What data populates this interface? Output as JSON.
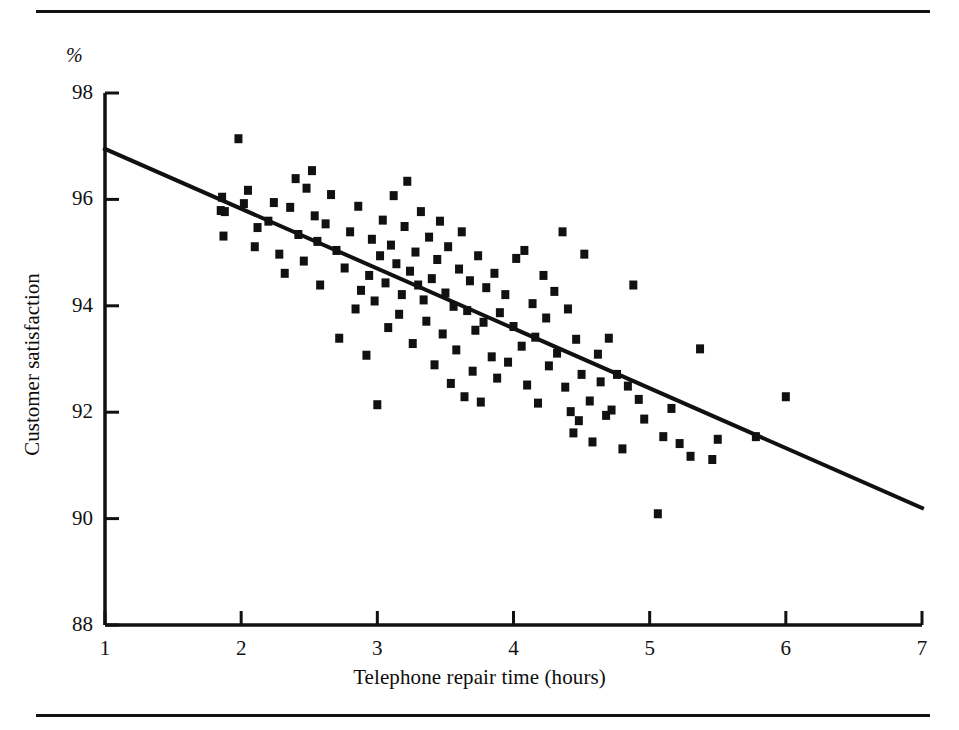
{
  "figure": {
    "has_top_rule": true,
    "has_bottom_rule": true,
    "ink_color": "#111111",
    "background_color": "#ffffff"
  },
  "chart_data": {
    "type": "scatter",
    "title": "",
    "subtitle": "",
    "xlabel": "Telephone repair time (hours)",
    "ylabel": "Customer satisfaction",
    "unit_label": "%",
    "xlim": [
      1,
      7
    ],
    "ylim": [
      88,
      98
    ],
    "xticks": [
      1,
      2,
      3,
      4,
      5,
      6,
      7
    ],
    "yticks": [
      88,
      90,
      92,
      94,
      96,
      98
    ],
    "xtick_labels": [
      "1",
      "2",
      "3",
      "4",
      "5",
      "6",
      "7"
    ],
    "ytick_labels": [
      "88",
      "90",
      "92",
      "94",
      "96",
      "98"
    ],
    "grid": false,
    "legend": null,
    "marker": "square",
    "marker_color": "#111111",
    "marker_size_px": 8,
    "trendline": {
      "type": "linear-fit",
      "color": "#111111",
      "width_px": 4,
      "x_start": 1.0,
      "y_start": 96.95,
      "x_end": 7.0,
      "y_end": 90.2,
      "slope": -1.125,
      "intercept": 98.075
    },
    "series": [
      {
        "name": "Repair time vs satisfaction",
        "points": [
          [
            1.98,
            97.15
          ],
          [
            1.86,
            96.05
          ],
          [
            1.88,
            95.78
          ],
          [
            1.85,
            95.8
          ],
          [
            1.87,
            95.32
          ],
          [
            2.02,
            95.93
          ],
          [
            2.05,
            96.18
          ],
          [
            2.12,
            95.48
          ],
          [
            2.1,
            95.12
          ],
          [
            2.2,
            95.6
          ],
          [
            2.24,
            95.95
          ],
          [
            2.28,
            94.98
          ],
          [
            2.32,
            94.62
          ],
          [
            2.36,
            95.86
          ],
          [
            2.4,
            96.4
          ],
          [
            2.42,
            95.35
          ],
          [
            2.46,
            94.85
          ],
          [
            2.48,
            96.22
          ],
          [
            2.52,
            96.55
          ],
          [
            2.54,
            95.7
          ],
          [
            2.56,
            95.22
          ],
          [
            2.58,
            94.4
          ],
          [
            2.62,
            95.55
          ],
          [
            2.66,
            96.1
          ],
          [
            2.7,
            95.05
          ],
          [
            2.72,
            93.4
          ],
          [
            2.76,
            94.72
          ],
          [
            2.8,
            95.4
          ],
          [
            2.84,
            93.95
          ],
          [
            2.86,
            95.88
          ],
          [
            2.88,
            94.3
          ],
          [
            2.92,
            93.08
          ],
          [
            2.94,
            94.58
          ],
          [
            2.96,
            95.26
          ],
          [
            2.98,
            94.1
          ],
          [
            3.0,
            92.15
          ],
          [
            3.02,
            94.95
          ],
          [
            3.04,
            95.62
          ],
          [
            3.06,
            94.44
          ],
          [
            3.08,
            93.6
          ],
          [
            3.1,
            95.15
          ],
          [
            3.12,
            96.08
          ],
          [
            3.14,
            94.8
          ],
          [
            3.16,
            93.85
          ],
          [
            3.18,
            94.22
          ],
          [
            3.2,
            95.5
          ],
          [
            3.22,
            96.35
          ],
          [
            3.24,
            94.66
          ],
          [
            3.26,
            93.3
          ],
          [
            3.28,
            95.02
          ],
          [
            3.3,
            94.4
          ],
          [
            3.32,
            95.78
          ],
          [
            3.34,
            94.12
          ],
          [
            3.36,
            93.72
          ],
          [
            3.38,
            95.3
          ],
          [
            3.4,
            94.52
          ],
          [
            3.42,
            92.9
          ],
          [
            3.44,
            94.88
          ],
          [
            3.46,
            95.6
          ],
          [
            3.48,
            93.48
          ],
          [
            3.5,
            94.25
          ],
          [
            3.52,
            95.12
          ],
          [
            3.54,
            92.55
          ],
          [
            3.56,
            94.0
          ],
          [
            3.58,
            93.18
          ],
          [
            3.6,
            94.7
          ],
          [
            3.62,
            95.4
          ],
          [
            3.64,
            92.3
          ],
          [
            3.66,
            93.92
          ],
          [
            3.68,
            94.48
          ],
          [
            3.7,
            92.78
          ],
          [
            3.72,
            93.55
          ],
          [
            3.74,
            94.95
          ],
          [
            3.76,
            92.2
          ],
          [
            3.78,
            93.7
          ],
          [
            3.8,
            94.35
          ],
          [
            3.84,
            93.05
          ],
          [
            3.86,
            94.62
          ],
          [
            3.88,
            92.65
          ],
          [
            3.9,
            93.88
          ],
          [
            3.94,
            94.22
          ],
          [
            3.96,
            92.95
          ],
          [
            4.0,
            93.62
          ],
          [
            4.02,
            94.9
          ],
          [
            4.06,
            93.25
          ],
          [
            4.08,
            95.05
          ],
          [
            4.1,
            92.52
          ],
          [
            4.14,
            94.05
          ],
          [
            4.16,
            93.42
          ],
          [
            4.18,
            92.18
          ],
          [
            4.22,
            94.58
          ],
          [
            4.24,
            93.78
          ],
          [
            4.26,
            92.88
          ],
          [
            4.3,
            94.28
          ],
          [
            4.32,
            93.12
          ],
          [
            4.36,
            95.4
          ],
          [
            4.38,
            92.48
          ],
          [
            4.4,
            93.95
          ],
          [
            4.42,
            92.02
          ],
          [
            4.44,
            91.62
          ],
          [
            4.46,
            93.38
          ],
          [
            4.48,
            91.85
          ],
          [
            4.5,
            92.72
          ],
          [
            4.52,
            94.98
          ],
          [
            4.56,
            92.22
          ],
          [
            4.58,
            91.45
          ],
          [
            4.62,
            93.1
          ],
          [
            4.64,
            92.58
          ],
          [
            4.68,
            91.95
          ],
          [
            4.7,
            93.4
          ],
          [
            4.72,
            92.05
          ],
          [
            4.76,
            92.72
          ],
          [
            4.8,
            91.32
          ],
          [
            4.84,
            92.5
          ],
          [
            4.88,
            94.4
          ],
          [
            4.92,
            92.25
          ],
          [
            4.96,
            91.88
          ],
          [
            5.06,
            90.1
          ],
          [
            5.1,
            91.55
          ],
          [
            5.16,
            92.08
          ],
          [
            5.22,
            91.42
          ],
          [
            5.3,
            91.18
          ],
          [
            5.37,
            93.2
          ],
          [
            5.46,
            91.12
          ],
          [
            5.5,
            91.5
          ],
          [
            5.78,
            91.55
          ],
          [
            6.0,
            92.3
          ]
        ]
      }
    ],
    "n_points": 130,
    "correlation": "negative"
  }
}
